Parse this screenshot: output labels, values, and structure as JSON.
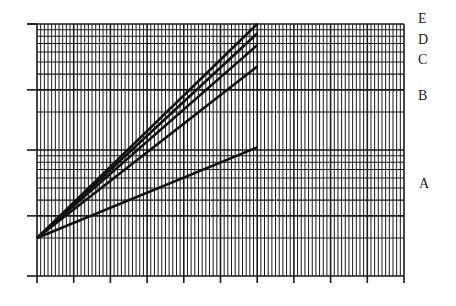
{
  "chart_data": {
    "type": "line",
    "title": "",
    "xlabel": "",
    "ylabel": "",
    "y_scale": "log",
    "grid": true,
    "xlim": [
      0,
      10
    ],
    "ylim": [
      1,
      100
    ],
    "x_major_ticks": [
      0,
      1,
      2,
      3,
      4,
      5,
      6,
      7,
      8,
      9,
      10
    ],
    "x_minor_per_major": 10,
    "y_decades": [
      1,
      10,
      100
    ],
    "tick_labels_visible": false,
    "legend_position": "right, inline labels",
    "series": [
      {
        "name": "A",
        "x": [
          0,
          6
        ],
        "y": [
          2,
          10.5
        ]
      },
      {
        "name": "B",
        "x": [
          0,
          6
        ],
        "y": [
          2,
          46
        ]
      },
      {
        "name": "C",
        "x": [
          0,
          6
        ],
        "y": [
          2,
          68
        ]
      },
      {
        "name": "D",
        "x": [
          0,
          6
        ],
        "y": [
          2,
          84
        ]
      },
      {
        "name": "E",
        "x": [
          0,
          6
        ],
        "y": [
          2,
          100
        ]
      }
    ]
  },
  "labels": {
    "E": "E",
    "D": "D",
    "C": "C",
    "B": "B",
    "A": "A"
  },
  "colors": {
    "grid": "#1a1a1a",
    "lines": "#111111",
    "background": "#ffffff"
  }
}
